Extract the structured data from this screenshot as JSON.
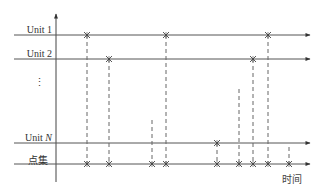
{
  "diagram": {
    "type": "event-timeline",
    "rows": [
      {
        "label": "Unit 1",
        "label_prefix": "Unit ",
        "label_suffix": "1",
        "y": 35,
        "events": [
          87,
          166,
          268
        ]
      },
      {
        "label": "Unit 2",
        "label_prefix": "Unit ",
        "label_suffix": "2",
        "y": 59,
        "events": [
          109,
          253
        ]
      },
      {
        "label": "⋮",
        "y": 90,
        "events": []
      },
      {
        "label": "Unit N",
        "label_prefix": "Unit ",
        "label_suffix": "N",
        "y": 143,
        "events": [
          217
        ]
      },
      {
        "label": "点集",
        "y": 164,
        "events": [
          87,
          109,
          152,
          166,
          217,
          239,
          253,
          268,
          289
        ]
      }
    ],
    "hidden_unit_dashes": [
      {
        "x": 152,
        "from_y": 120
      },
      {
        "x": 239,
        "from_y": 89
      },
      {
        "x": 289,
        "from_y": 147
      }
    ],
    "time_axis_label": "时间",
    "vertical_ellipsis": "⋮",
    "colors": {
      "line": "#555555",
      "dash": "#666666",
      "marker": "#444444"
    }
  }
}
